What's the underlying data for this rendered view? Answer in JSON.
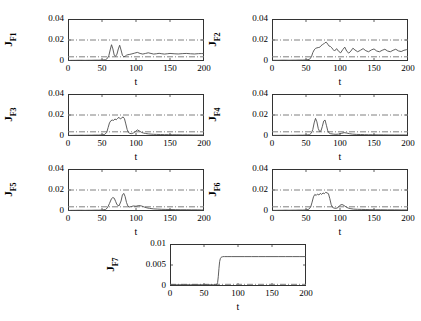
{
  "figure": {
    "background": "#ffffff",
    "line_color": "#4d4d4d",
    "threshold_color": "#808080",
    "axis_color": "#333333"
  },
  "chart_data": [
    {
      "type": "line",
      "title": "",
      "ylabel": "J",
      "ylabel_sub": "F1",
      "xlabel": "t",
      "xlim": [
        0,
        200
      ],
      "ylim": [
        0,
        0.04
      ],
      "xticks": [
        0,
        50,
        100,
        150,
        200
      ],
      "yticks": [
        0,
        0.02,
        0.04
      ],
      "ytick_labels": [
        "0",
        "0.02",
        "0.04"
      ],
      "xtick_labels": [
        "0",
        "50",
        "100",
        "150",
        "200"
      ],
      "grid": false,
      "thresholds": [
        0.02,
        0.004
      ],
      "series": [
        {
          "name": "J_F1",
          "x": [
            0,
            5,
            10,
            15,
            20,
            25,
            30,
            35,
            40,
            45,
            50,
            55,
            58,
            60,
            62,
            64,
            66,
            68,
            70,
            72,
            74,
            76,
            78,
            80,
            82,
            84,
            86,
            88,
            90,
            94,
            98,
            102,
            106,
            110,
            114,
            118,
            122,
            126,
            130,
            134,
            138,
            142,
            146,
            150,
            156,
            162,
            168,
            174,
            180,
            186,
            192,
            196,
            200
          ],
          "values": [
            0.0005,
            0.0006,
            0.0006,
            0.0007,
            0.0007,
            0.0006,
            0.0007,
            0.0007,
            0.0008,
            0.0008,
            0.0009,
            0.0012,
            0.0025,
            0.005,
            0.0105,
            0.0155,
            0.0115,
            0.0055,
            0.0045,
            0.0065,
            0.0115,
            0.015,
            0.0105,
            0.0055,
            0.004,
            0.0045,
            0.0055,
            0.006,
            0.0062,
            0.0068,
            0.0075,
            0.0082,
            0.0072,
            0.0066,
            0.0072,
            0.0078,
            0.0072,
            0.0066,
            0.0069,
            0.0073,
            0.0069,
            0.0066,
            0.0069,
            0.0072,
            0.0069,
            0.0067,
            0.007,
            0.0072,
            0.0069,
            0.0067,
            0.007,
            0.0071,
            0.007
          ]
        }
      ]
    },
    {
      "type": "line",
      "title": "",
      "ylabel": "J",
      "ylabel_sub": "F2",
      "xlabel": "t",
      "xlim": [
        0,
        200
      ],
      "ylim": [
        0,
        0.04
      ],
      "xticks": [
        0,
        50,
        100,
        150,
        200
      ],
      "yticks": [
        0,
        0.02,
        0.04
      ],
      "ytick_labels": [
        "0",
        "0.02",
        "0.04"
      ],
      "xtick_labels": [
        "0",
        "50",
        "100",
        "150",
        "200"
      ],
      "grid": false,
      "thresholds": [
        0.02,
        0.004
      ],
      "series": [
        {
          "name": "J_F2",
          "x": [
            0,
            5,
            10,
            15,
            20,
            25,
            30,
            35,
            40,
            45,
            50,
            55,
            58,
            60,
            62,
            64,
            66,
            68,
            70,
            72,
            74,
            76,
            78,
            80,
            82,
            84,
            86,
            88,
            90,
            92,
            95,
            98,
            101,
            104,
            107,
            110,
            113,
            116,
            119,
            122,
            126,
            130,
            134,
            138,
            142,
            146,
            150,
            154,
            158,
            162,
            166,
            170,
            174,
            178,
            182,
            186,
            190,
            194,
            198,
            200
          ],
          "values": [
            0.0006,
            0.0007,
            0.0007,
            0.0008,
            0.0008,
            0.0007,
            0.0008,
            0.0008,
            0.0009,
            0.0009,
            0.001,
            0.0015,
            0.004,
            0.008,
            0.0105,
            0.012,
            0.0125,
            0.0128,
            0.013,
            0.0145,
            0.0155,
            0.0162,
            0.0175,
            0.0178,
            0.016,
            0.0142,
            0.0138,
            0.0125,
            0.0108,
            0.0095,
            0.0118,
            0.0092,
            0.0078,
            0.0108,
            0.0132,
            0.0092,
            0.0075,
            0.0095,
            0.0122,
            0.0105,
            0.0088,
            0.0102,
            0.0118,
            0.0098,
            0.0088,
            0.0105,
            0.0115,
            0.0095,
            0.0088,
            0.0102,
            0.0112,
            0.0095,
            0.0088,
            0.0102,
            0.0112,
            0.0096,
            0.009,
            0.0102,
            0.0108,
            0.0102
          ]
        }
      ]
    },
    {
      "type": "line",
      "title": "",
      "ylabel": "J",
      "ylabel_sub": "F3",
      "xlabel": "t",
      "xlim": [
        0,
        200
      ],
      "ylim": [
        0,
        0.04
      ],
      "xticks": [
        0,
        50,
        100,
        150,
        200
      ],
      "yticks": [
        0,
        0.02,
        0.04
      ],
      "ytick_labels": [
        "0",
        "0.02",
        "0.04"
      ],
      "xtick_labels": [
        "0",
        "50",
        "100",
        "150",
        "200"
      ],
      "grid": false,
      "thresholds": [
        0.02,
        0.004
      ],
      "series": [
        {
          "name": "J_F3",
          "x": [
            0,
            5,
            10,
            15,
            20,
            25,
            30,
            35,
            40,
            45,
            50,
            54,
            57,
            59,
            61,
            63,
            65,
            67,
            69,
            71,
            73,
            75,
            77,
            79,
            81,
            83,
            85,
            87,
            89,
            91,
            93,
            96,
            99,
            102,
            105,
            108,
            111,
            114,
            118,
            122,
            126,
            130,
            136,
            142,
            148,
            154,
            160,
            168,
            176,
            184,
            192,
            200
          ],
          "values": [
            0.0006,
            0.0006,
            0.0007,
            0.0007,
            0.0008,
            0.0007,
            0.0008,
            0.0008,
            0.0009,
            0.0009,
            0.001,
            0.0015,
            0.0035,
            0.008,
            0.0125,
            0.0145,
            0.0152,
            0.0148,
            0.0162,
            0.0155,
            0.0168,
            0.0178,
            0.0162,
            0.0172,
            0.0182,
            0.0165,
            0.0115,
            0.0062,
            0.0032,
            0.0025,
            0.0022,
            0.0028,
            0.0042,
            0.0058,
            0.0048,
            0.0035,
            0.0028,
            0.0024,
            0.002,
            0.0018,
            0.0016,
            0.0015,
            0.0014,
            0.0013,
            0.0013,
            0.0012,
            0.0012,
            0.0011,
            0.0011,
            0.001,
            0.001,
            0.001
          ]
        }
      ]
    },
    {
      "type": "line",
      "title": "",
      "ylabel": "J",
      "ylabel_sub": "F4",
      "xlabel": "t",
      "xlim": [
        0,
        200
      ],
      "ylim": [
        0,
        0.04
      ],
      "xticks": [
        0,
        50,
        100,
        150,
        200
      ],
      "yticks": [
        0,
        0.02,
        0.04
      ],
      "ytick_labels": [
        "0",
        "0.02",
        "0.04"
      ],
      "xtick_labels": [
        "0",
        "50",
        "100",
        "150",
        "200"
      ],
      "grid": false,
      "thresholds": [
        0.02,
        0.004
      ],
      "series": [
        {
          "name": "J_F4",
          "x": [
            0,
            5,
            10,
            15,
            20,
            25,
            30,
            35,
            40,
            45,
            50,
            55,
            58,
            60,
            62,
            64,
            66,
            68,
            70,
            72,
            74,
            76,
            78,
            80,
            82,
            84,
            86,
            90,
            94,
            98,
            102,
            106,
            110,
            114,
            118,
            124,
            130,
            136,
            142,
            148,
            156,
            164,
            172,
            180,
            188,
            196,
            200
          ],
          "values": [
            0.0005,
            0.0006,
            0.0006,
            0.0007,
            0.0007,
            0.0006,
            0.0007,
            0.0007,
            0.0008,
            0.0008,
            0.0009,
            0.0012,
            0.0028,
            0.0062,
            0.0125,
            0.0168,
            0.0135,
            0.0072,
            0.0042,
            0.0048,
            0.009,
            0.0142,
            0.0152,
            0.0102,
            0.005,
            0.0028,
            0.0022,
            0.0018,
            0.0016,
            0.0018,
            0.0025,
            0.0032,
            0.0028,
            0.0022,
            0.0018,
            0.0015,
            0.0014,
            0.0013,
            0.0012,
            0.0012,
            0.0011,
            0.0011,
            0.001,
            0.001,
            0.001,
            0.001,
            0.001
          ]
        }
      ]
    },
    {
      "type": "line",
      "title": "",
      "ylabel": "J",
      "ylabel_sub": "F5",
      "xlabel": "t",
      "xlim": [
        0,
        200
      ],
      "ylim": [
        0,
        0.04
      ],
      "xticks": [
        0,
        50,
        100,
        150,
        200
      ],
      "yticks": [
        0,
        0.02,
        0.04
      ],
      "ytick_labels": [
        "0",
        "0.02",
        "0.04"
      ],
      "xtick_labels": [
        "0",
        "50",
        "100",
        "150",
        "200"
      ],
      "grid": false,
      "thresholds": [
        0.02,
        0.004
      ],
      "series": [
        {
          "name": "J_F5",
          "x": [
            0,
            5,
            10,
            15,
            20,
            25,
            30,
            35,
            40,
            45,
            50,
            55,
            58,
            61,
            64,
            66,
            68,
            70,
            72,
            75,
            78,
            80,
            82,
            84,
            86,
            88,
            90,
            93,
            96,
            100,
            104,
            108,
            112,
            116,
            120,
            126,
            132,
            138,
            144,
            150,
            158,
            166,
            174,
            182,
            190,
            196,
            200
          ],
          "values": [
            0.0005,
            0.0006,
            0.0006,
            0.0007,
            0.0007,
            0.0006,
            0.0007,
            0.0007,
            0.0008,
            0.0008,
            0.0009,
            0.0014,
            0.003,
            0.0072,
            0.0118,
            0.0128,
            0.0122,
            0.0092,
            0.006,
            0.0048,
            0.0095,
            0.0152,
            0.0168,
            0.0138,
            0.0082,
            0.0048,
            0.0038,
            0.0042,
            0.0048,
            0.0045,
            0.0052,
            0.0048,
            0.0038,
            0.003,
            0.0025,
            0.002,
            0.0018,
            0.0016,
            0.0015,
            0.0014,
            0.0013,
            0.0012,
            0.0012,
            0.0011,
            0.0011,
            0.001,
            0.001
          ]
        }
      ]
    },
    {
      "type": "line",
      "title": "",
      "ylabel": "J",
      "ylabel_sub": "F6",
      "xlabel": "t",
      "xlim": [
        0,
        200
      ],
      "ylim": [
        0,
        0.04
      ],
      "xticks": [
        0,
        50,
        100,
        150,
        200
      ],
      "yticks": [
        0,
        0.02,
        0.04
      ],
      "ytick_labels": [
        "0",
        "0.02",
        "0.04"
      ],
      "xtick_labels": [
        "0",
        "50",
        "100",
        "150",
        "200"
      ],
      "grid": false,
      "thresholds": [
        0.02,
        0.004
      ],
      "series": [
        {
          "name": "J_F6",
          "x": [
            0,
            5,
            10,
            15,
            20,
            25,
            30,
            35,
            40,
            45,
            50,
            54,
            57,
            59,
            61,
            63,
            65,
            67,
            69,
            71,
            73,
            75,
            77,
            79,
            81,
            83,
            85,
            87,
            89,
            91,
            94,
            97,
            100,
            103,
            106,
            109,
            112,
            116,
            120,
            126,
            132,
            138,
            144,
            152,
            160,
            170,
            180,
            190,
            200
          ],
          "values": [
            0.0006,
            0.0006,
            0.0007,
            0.0007,
            0.0008,
            0.0007,
            0.0008,
            0.0008,
            0.0009,
            0.0009,
            0.001,
            0.0016,
            0.004,
            0.0085,
            0.0135,
            0.0158,
            0.0148,
            0.0162,
            0.0152,
            0.0168,
            0.0158,
            0.0172,
            0.0165,
            0.0178,
            0.0172,
            0.0165,
            0.0118,
            0.0062,
            0.0035,
            0.0028,
            0.0025,
            0.0032,
            0.0055,
            0.0062,
            0.0052,
            0.0038,
            0.0028,
            0.0022,
            0.0018,
            0.0016,
            0.0015,
            0.0014,
            0.0013,
            0.0012,
            0.0012,
            0.0011,
            0.0011,
            0.001,
            0.001
          ]
        }
      ]
    },
    {
      "type": "line",
      "title": "",
      "ylabel": "J",
      "ylabel_sub": "F7",
      "xlabel": "t",
      "xlim": [
        0,
        200
      ],
      "ylim": [
        0,
        0.01
      ],
      "xticks": [
        0,
        50,
        100,
        150,
        200
      ],
      "yticks": [
        0,
        0.005,
        0.01
      ],
      "ytick_labels": [
        "0",
        "0.005",
        "0.01"
      ],
      "xtick_labels": [
        "0",
        "50",
        "100",
        "150",
        "200"
      ],
      "grid": false,
      "thresholds": [
        0.0004
      ],
      "series": [
        {
          "name": "J_F7",
          "x": [
            0,
            10,
            20,
            30,
            40,
            50,
            55,
            60,
            64,
            67,
            69,
            70,
            71,
            72,
            73,
            74,
            75,
            76,
            77,
            78,
            80,
            84,
            90,
            100,
            110,
            120,
            130,
            140,
            150,
            160,
            170,
            180,
            190,
            200
          ],
          "values": [
            0.0003,
            0.0003,
            0.0003,
            0.0003,
            0.0003,
            0.0003,
            0.0003,
            0.0003,
            0.0003,
            0.0003,
            0.0004,
            0.0008,
            0.0022,
            0.0042,
            0.0058,
            0.0065,
            0.0068,
            0.0069,
            0.00695,
            0.007,
            0.007,
            0.007,
            0.007,
            0.007,
            0.007,
            0.007,
            0.007,
            0.007,
            0.007,
            0.007,
            0.007,
            0.007,
            0.007,
            0.007
          ]
        }
      ]
    }
  ]
}
